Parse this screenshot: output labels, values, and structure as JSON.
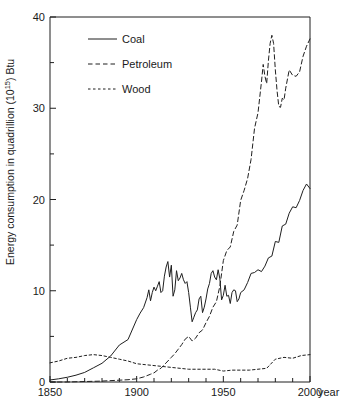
{
  "chart_data": {
    "type": "line",
    "title": "",
    "xlabel": "year",
    "ylabel": "Energy consumption in quadrillion (10",
    "ylabel_sup": "15",
    "ylabel_tail": ") Btu",
    "xlim": [
      1850,
      2000
    ],
    "ylim": [
      0,
      40
    ],
    "grid": false,
    "legend_position": "top-left-inside",
    "x_ticks_major": [
      1850,
      1900,
      1950,
      2000
    ],
    "x_tick_labels": [
      "1850",
      "1900",
      "1950",
      "2000"
    ],
    "x_ticks_minor": [
      1860,
      1870,
      1880,
      1890,
      1910,
      1920,
      1930,
      1940,
      1960,
      1970,
      1980,
      1990
    ],
    "y_ticks_major": [
      0,
      10,
      20,
      30,
      40
    ],
    "y_tick_labels": [
      "0",
      "10",
      "20",
      "30",
      "40"
    ],
    "y_ticks_minor": [
      5,
      15,
      25,
      35
    ],
    "series": [
      {
        "name": "Coal",
        "style": "solid",
        "color": "#1f1f1f",
        "x": [
          1850,
          1855,
          1860,
          1865,
          1870,
          1875,
          1880,
          1885,
          1890,
          1895,
          1900,
          1902,
          1904,
          1906,
          1907,
          1908,
          1909,
          1910,
          1911,
          1912,
          1913,
          1914,
          1915,
          1916,
          1917,
          1918,
          1919,
          1920,
          1921,
          1922,
          1923,
          1924,
          1925,
          1926,
          1927,
          1928,
          1929,
          1930,
          1931,
          1932,
          1933,
          1934,
          1935,
          1936,
          1937,
          1938,
          1939,
          1940,
          1941,
          1942,
          1943,
          1944,
          1945,
          1946,
          1947,
          1948,
          1949,
          1950,
          1951,
          1952,
          1953,
          1954,
          1955,
          1956,
          1957,
          1958,
          1959,
          1960,
          1962,
          1964,
          1966,
          1968,
          1970,
          1972,
          1974,
          1976,
          1978,
          1980,
          1982,
          1984,
          1986,
          1988,
          1990,
          1992,
          1994,
          1996,
          1998,
          2000
        ],
        "y": [
          0.22,
          0.35,
          0.52,
          0.75,
          1.05,
          1.55,
          2.05,
          2.85,
          4.05,
          4.65,
          6.84,
          7.55,
          8.15,
          9.25,
          10.1,
          8.9,
          9.8,
          10.4,
          10.0,
          10.5,
          11.0,
          9.8,
          10.0,
          11.6,
          12.6,
          13.2,
          11.5,
          12.8,
          9.4,
          10.1,
          12.2,
          11.1,
          11.4,
          11.9,
          11.2,
          10.8,
          11.0,
          9.8,
          8.2,
          6.6,
          7.1,
          7.6,
          7.9,
          9.1,
          9.4,
          7.6,
          8.2,
          9.1,
          10.2,
          10.8,
          11.9,
          12.2,
          11.5,
          11.2,
          12.3,
          11.3,
          9.0,
          9.5,
          10.6,
          9.4,
          9.5,
          8.6,
          9.8,
          10.1,
          10.0,
          8.8,
          9.1,
          9.8,
          10.1,
          10.9,
          11.9,
          12.0,
          12.3,
          12.1,
          12.7,
          13.6,
          13.8,
          15.4,
          15.3,
          17.1,
          17.3,
          18.5,
          19.2,
          19.1,
          19.9,
          21.0,
          21.7,
          21.2
        ]
      },
      {
        "name": "Petroleum",
        "style": "dashed",
        "color": "#1f1f1f",
        "x": [
          1850,
          1860,
          1870,
          1880,
          1890,
          1895,
          1900,
          1902,
          1904,
          1906,
          1908,
          1910,
          1912,
          1914,
          1916,
          1918,
          1920,
          1922,
          1924,
          1926,
          1928,
          1930,
          1932,
          1934,
          1936,
          1938,
          1940,
          1942,
          1944,
          1946,
          1948,
          1950,
          1952,
          1954,
          1956,
          1958,
          1960,
          1962,
          1964,
          1966,
          1968,
          1970,
          1972,
          1973,
          1974,
          1975,
          1976,
          1977,
          1978,
          1979,
          1980,
          1981,
          1982,
          1983,
          1984,
          1985,
          1986,
          1988,
          1990,
          1992,
          1994,
          1996,
          1998,
          2000
        ],
        "y": [
          0.0,
          0.0,
          0.05,
          0.1,
          0.2,
          0.25,
          0.35,
          0.45,
          0.55,
          0.7,
          0.85,
          1.0,
          1.3,
          1.5,
          1.9,
          2.3,
          2.7,
          3.1,
          3.6,
          4.1,
          4.7,
          5.0,
          4.5,
          4.8,
          5.4,
          5.7,
          6.5,
          7.2,
          8.2,
          8.8,
          10.5,
          13.3,
          14.4,
          14.8,
          16.5,
          17.2,
          19.9,
          21.0,
          22.3,
          24.4,
          27.8,
          29.5,
          32.9,
          34.8,
          33.5,
          32.7,
          35.2,
          37.1,
          38.0,
          37.1,
          34.2,
          31.9,
          30.2,
          30.1,
          31.1,
          30.9,
          32.2,
          34.2,
          33.6,
          33.5,
          34.0,
          35.7,
          36.8,
          37.6
        ]
      },
      {
        "name": "Wood",
        "style": "dotted",
        "color": "#1f1f1f",
        "x": [
          1850,
          1855,
          1860,
          1865,
          1870,
          1875,
          1880,
          1885,
          1890,
          1895,
          1900,
          1905,
          1910,
          1915,
          1920,
          1925,
          1930,
          1935,
          1940,
          1945,
          1950,
          1955,
          1960,
          1965,
          1970,
          1975,
          1980,
          1985,
          1990,
          1995,
          2000
        ],
        "y": [
          2.1,
          2.3,
          2.6,
          2.7,
          2.9,
          3.0,
          2.9,
          2.7,
          2.5,
          2.3,
          2.0,
          1.9,
          1.8,
          1.7,
          1.6,
          1.5,
          1.4,
          1.4,
          1.4,
          1.4,
          1.2,
          1.3,
          1.3,
          1.3,
          1.4,
          1.5,
          2.5,
          2.7,
          2.6,
          2.9,
          3.0
        ]
      }
    ]
  },
  "legend": {
    "items": [
      {
        "label": "Coal",
        "style": "solid"
      },
      {
        "label": "Petroleum",
        "style": "dashed"
      },
      {
        "label": "Wood",
        "style": "dotted"
      }
    ]
  },
  "axes": {
    "x_axis_label": "year",
    "y_axis_label_prefix": "Energy consumption in quadrillion (10",
    "y_axis_label_sup": "15",
    "y_axis_label_suffix": ") Btu"
  }
}
